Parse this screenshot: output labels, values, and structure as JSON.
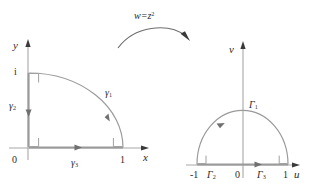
{
  "figure": {
    "caption_map": {
      "w": "w",
      "equals": "=",
      "z": "z",
      "exponent": "2",
      "full": "w = z²"
    },
    "left_plane": {
      "name": "z-plane",
      "axes": {
        "horizontal_label": "x",
        "vertical_label": "y"
      },
      "ticks": [
        {
          "label": "0",
          "axis": "origin"
        },
        {
          "label": "1",
          "axis": "horizontal"
        },
        {
          "label": "i",
          "axis": "vertical"
        }
      ],
      "curves": [
        {
          "base": "γ",
          "subscript": "1",
          "kind": "quarter-circle-arc"
        },
        {
          "base": "γ",
          "subscript": "2",
          "kind": "vertical-segment"
        },
        {
          "base": "γ",
          "subscript": "3",
          "kind": "horizontal-segment"
        }
      ],
      "right_angle_marks": 3
    },
    "right_plane": {
      "name": "w-plane",
      "axes": {
        "horizontal_label": "u",
        "vertical_label": "v"
      },
      "ticks": [
        {
          "label": "-1",
          "axis": "horizontal"
        },
        {
          "label": "0",
          "axis": "origin"
        },
        {
          "label": "1",
          "axis": "horizontal"
        }
      ],
      "curves": [
        {
          "base": "Γ",
          "subscript": "1",
          "kind": "semicircle-arc"
        },
        {
          "base": "Γ",
          "subscript": "2",
          "kind": "horizontal-segment-left"
        },
        {
          "base": "Γ",
          "subscript": "3",
          "kind": "horizontal-segment-right"
        }
      ],
      "right_angle_marks": 2
    },
    "colors": {
      "stroke": "#9a9a9a",
      "arrow": "#4a4a4a",
      "text": "#2b2b2b",
      "background": "#ffffff"
    }
  }
}
